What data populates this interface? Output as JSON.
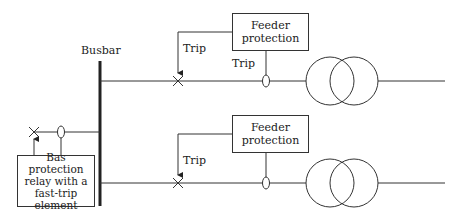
{
  "diagram": {
    "busbar_label": "Busbar",
    "bus_protection": {
      "label_lines": [
        "Bas protection",
        "relay with a",
        "fast-trip",
        "element"
      ]
    },
    "feeders": [
      {
        "protection_lines": [
          "Feeder",
          "protection"
        ],
        "trip_label_breaker": "Trip",
        "trip_label_ct": "Trip"
      },
      {
        "protection_lines": [
          "Feeder",
          "protection"
        ],
        "trip_label_breaker": "Trip"
      }
    ],
    "colors": {
      "line": "#333333",
      "background": "#ffffff"
    }
  }
}
